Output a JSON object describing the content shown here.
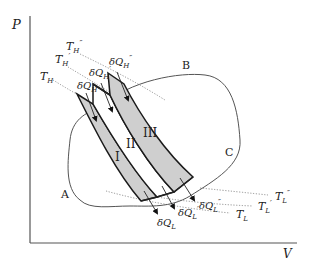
{
  "diagram": {
    "type": "thermodynamic P-V diagram with Carnot strips",
    "axes": {
      "y_label": "P",
      "x_label": "V"
    },
    "cycle_points": {
      "a": "A",
      "b": "B",
      "c": "C"
    },
    "strips": {
      "s1": "I",
      "s2": "II",
      "s3": "III"
    },
    "hot_isotherms": {
      "t1": "T",
      "t1_sub": "H",
      "t1_prime": "",
      "t2": "T",
      "t2_sub": "H",
      "t2_prime": "′",
      "t3": "T",
      "t3_sub": "H",
      "t3_prime": "″"
    },
    "cold_isotherms": {
      "t1": "T",
      "t1_sub": "L",
      "t1_prime": "",
      "t2": "T",
      "t2_sub": "L",
      "t2_prime": "′",
      "t3": "T",
      "t3_sub": "L",
      "t3_prime": "″"
    },
    "heat_in": {
      "q1": "δQ",
      "q1_sub": "H",
      "q1_prime": "",
      "q2": "δQ",
      "q2_sub": "H",
      "q2_prime": "′",
      "q3": "δQ",
      "q3_sub": "H",
      "q3_prime": "″"
    },
    "heat_out": {
      "q1": "δQ",
      "q1_sub": "L",
      "q1_prime": "",
      "q2": "δQ",
      "q2_sub": "L",
      "q2_prime": "′",
      "q3": "δQ",
      "q3_sub": "L",
      "q3_prime": "″"
    },
    "colors": {
      "strip_fill": "#cfcfcf",
      "strip_stroke": "#1a1a1a",
      "cycle": "#555555",
      "isotherm": "#777777"
    }
  }
}
